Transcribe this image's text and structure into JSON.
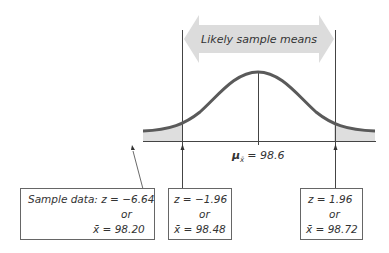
{
  "diagram": {
    "banner_label": "Likely sample means",
    "mean_label_symbol": "μ",
    "mean_label_sub": "x̄",
    "mean_label_value": "= 98.6",
    "colors": {
      "curve": "#5a5a5a",
      "banner_fill": "#dcdcdc",
      "tail_fill": "#dedede",
      "lines": "#444444"
    }
  },
  "boxes": {
    "sample": {
      "line1": "Sample data: z = −6.64",
      "line2": "or",
      "line3": "x̄ = 98.20"
    },
    "lower": {
      "line1": "z = −1.96",
      "line2": "or",
      "line3": "x̄ = 98.48"
    },
    "upper": {
      "line1": "z = 1.96",
      "line2": "or",
      "line3": "x̄ = 98.72"
    }
  }
}
